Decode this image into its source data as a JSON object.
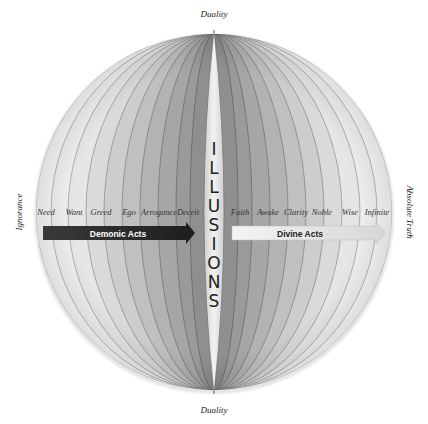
{
  "diagram": {
    "top_label": "Duality",
    "bottom_label": "Duality",
    "left_label": "Ignorance",
    "right_label": "Absolute Truth",
    "center_label": "ILLUSIONS",
    "center_letters": [
      "I",
      "L",
      "L",
      "U",
      "S",
      "I",
      "O",
      "N",
      "S"
    ],
    "left_stages": [
      "Need",
      "Want",
      "Greed",
      "Ego",
      "Arrogance",
      "Deceit"
    ],
    "right_stages": [
      "Faith",
      "Awake",
      "Clarity",
      "Noble",
      "Wise",
      "Infinite"
    ],
    "left_arrow": {
      "label": "Demonic Acts",
      "color": "#2b2b2b",
      "text_color": "#ffffff"
    },
    "right_arrow": {
      "label": "Divine Acts",
      "color": "#e8e8e8",
      "text_color": "#222222"
    }
  }
}
